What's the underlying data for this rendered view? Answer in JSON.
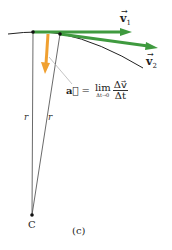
{
  "diagram": {
    "panel_label": "(c)",
    "center_label": "C",
    "radius_labels": [
      "r",
      "r"
    ],
    "vectors": {
      "v1": {
        "symbol": "v",
        "subscript": "1",
        "color": "#3f9a3f"
      },
      "v2": {
        "symbol": "v",
        "subscript": "2",
        "color": "#3f9a3f"
      },
      "a": {
        "symbol": "a",
        "color": "#f0a030"
      }
    },
    "equation": {
      "lhs": "a⃗",
      "equals": "=",
      "lim": "lim",
      "lim_sub": "Δt→0",
      "numerator": "Δv⃗",
      "denominator": "Δt"
    },
    "colors": {
      "arc": "#222222",
      "radius_line": "#444444",
      "velocity": "#3f9a3f",
      "acceleration": "#f0a030",
      "leader": "#aaaaaa"
    }
  }
}
